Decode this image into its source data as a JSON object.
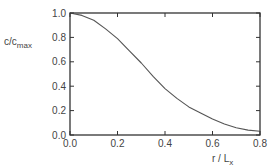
{
  "chart_data": {
    "type": "line",
    "title": "",
    "xlabel": "r / L_x",
    "ylabel": "c/c_max",
    "xlim": [
      0.0,
      0.8
    ],
    "ylim": [
      0.0,
      1.0
    ],
    "x_ticks": [
      "0.0",
      "0.2",
      "0.4",
      "0.6",
      "0.8"
    ],
    "y_ticks": [
      "0.0",
      "0.2",
      "0.4",
      "0.6",
      "0.8",
      "1.0"
    ],
    "grid": false,
    "legend": null,
    "series": [
      {
        "name": "c/c_max",
        "x": [
          0.0,
          0.05,
          0.1,
          0.15,
          0.2,
          0.25,
          0.3,
          0.35,
          0.4,
          0.45,
          0.5,
          0.55,
          0.6,
          0.65,
          0.7,
          0.75,
          0.8
        ],
        "y": [
          1.0,
          0.98,
          0.94,
          0.87,
          0.79,
          0.69,
          0.59,
          0.48,
          0.38,
          0.3,
          0.23,
          0.18,
          0.13,
          0.09,
          0.06,
          0.04,
          0.03
        ]
      }
    ]
  },
  "labels": {
    "ylabel_main": "c/c",
    "ylabel_sub": "max",
    "xlabel_main": "r / L",
    "xlabel_sub": "x"
  }
}
